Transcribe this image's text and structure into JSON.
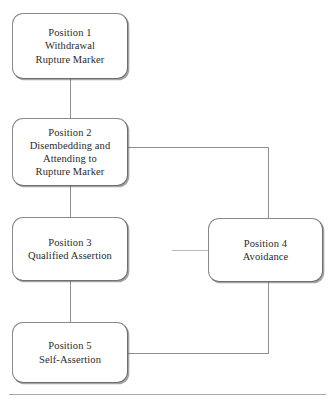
{
  "diagram": {
    "type": "flowchart",
    "orientation": "vertical-with-side-branch",
    "nodes": [
      {
        "id": "position-1",
        "label": "Position 1\nWithdrawal\nRupture Marker",
        "lines": [
          "Position 1",
          "Withdrawal",
          "Rupture Marker"
        ]
      },
      {
        "id": "position-2",
        "label": "Position 2\nDisembedding and\nAttending to\nRupture Marker",
        "lines": [
          "Position 2",
          "Disembedding and",
          "Attending to",
          "Rupture Marker"
        ]
      },
      {
        "id": "position-3",
        "label": "Position 3\nQualified Assertion",
        "lines": [
          "Position 3",
          "Qualified Assertion"
        ]
      },
      {
        "id": "position-4",
        "label": "Position 4\nAvoidance",
        "lines": [
          "Position 4",
          "Avoidance"
        ]
      },
      {
        "id": "position-5",
        "label": "Position 5\nSelf-Assertion",
        "lines": [
          "Position 5",
          "Self-Assertion"
        ]
      }
    ],
    "edges": [
      {
        "id": "e1",
        "from": "position-1",
        "to": "position-2",
        "style": "straight"
      },
      {
        "id": "e2",
        "from": "position-2",
        "to": "position-3",
        "style": "straight"
      },
      {
        "id": "e3",
        "from": "position-2",
        "to": "position-4",
        "style": "orthogonal"
      },
      {
        "id": "e4",
        "from": "position-3",
        "to": "position-4",
        "style": "stub"
      },
      {
        "id": "e5",
        "from": "position-3",
        "to": "position-5",
        "style": "straight"
      },
      {
        "id": "e6",
        "from": "position-4",
        "to": "position-5",
        "style": "orthogonal"
      }
    ]
  },
  "colors": {
    "background": "#ffffff",
    "node_fill": "#ffffff",
    "node_border": "#8a8a8a",
    "node_shadow": "#5a5a5a",
    "connector": "#8f8f8f",
    "connector_faint": "#b9b9b9",
    "text": "#2b2b2b",
    "rule": "#a9a9a9"
  }
}
